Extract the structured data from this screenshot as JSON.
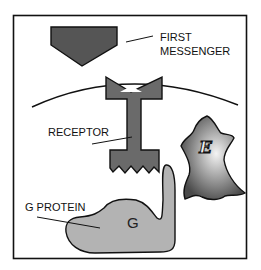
{
  "diagram": {
    "labels": {
      "first_messenger_line1": "FIRST",
      "first_messenger_line2": "MESSENGER",
      "receptor": "RECEPTOR",
      "g_protein": "G PROTEIN",
      "g_glyph": "G",
      "effector_glyph": "E"
    },
    "colors": {
      "dark": "#555555",
      "receptor": "#6a6a6a",
      "g_protein": "#b3b3b3",
      "outline": "#111111",
      "effector_light": "#f2f2f2",
      "effector_dark": "#4a4a4a"
    }
  }
}
